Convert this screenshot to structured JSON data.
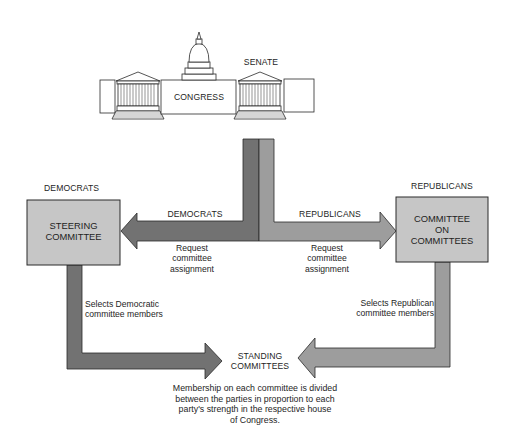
{
  "colors": {
    "democrat_flow": "#727272",
    "republican_flow": "#9d9d9d",
    "box_fill": "#c6c6c6",
    "outline": "#2a2a2a",
    "background": "#ffffff"
  },
  "capitol": {
    "center_label": "CONGRESS",
    "senate_label": "SENATE"
  },
  "flows": {
    "democrats_arrow_label": "DEMOCRATS",
    "republicans_arrow_label": "REPUBLICANS",
    "democrats_request": [
      "Request",
      "committee",
      "assignment"
    ],
    "republicans_request": [
      "Request",
      "committee",
      "assignment"
    ],
    "democrats_select": [
      "Selects Democratic",
      "committee members"
    ],
    "republicans_select": [
      "Selects Republican",
      "committee members"
    ]
  },
  "nodes": {
    "democrats_header": "DEMOCRATS",
    "republicans_header": "REPUBLICANS",
    "steering_committee": [
      "STEERING",
      "COMMITTEE"
    ],
    "committee_on_committees": [
      "COMMITTEE",
      "ON",
      "COMMITTEES"
    ],
    "standing_committees": [
      "STANDING",
      "COMMITTEES"
    ]
  },
  "note": [
    "Membership on each committee is divided",
    "between the parties in proportion to each",
    "party's strength in the respective house",
    "of Congress."
  ]
}
